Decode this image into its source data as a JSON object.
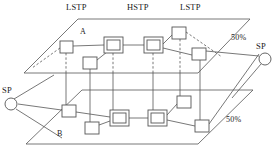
{
  "diagram": {
    "title_labels": {
      "lstp_left": "LSTP",
      "hstp_center": "HSTP",
      "lstp_right": "LSTP"
    },
    "plane_labels": {
      "top": "A",
      "bottom": "B"
    },
    "endpoint_labels": {
      "sp_left": "SP",
      "sp_right": "SP"
    },
    "percent_labels": {
      "top_right": "50%",
      "bottom_right": "50%"
    },
    "colors": {
      "line": "#555555",
      "node_fill": "#ffffff",
      "node_stroke": "#555555",
      "text": "#1a1a1a",
      "background": "#ffffff"
    },
    "planes": [
      {
        "name": "A",
        "corners": "78,19 250,19 198,73 24,73"
      },
      {
        "name": "B",
        "corners": "82,90 253,90 198,144 26,144"
      }
    ],
    "nodes": [
      {
        "id": "a-lstp-left",
        "type": "single",
        "plane": "A",
        "x": 60,
        "y": 41,
        "w": 13,
        "h": 12
      },
      {
        "id": "a-sub-left",
        "type": "single",
        "plane": "A",
        "x": 83,
        "y": 57,
        "w": 14,
        "h": 12
      },
      {
        "id": "a-hstp-1",
        "type": "double",
        "plane": "A",
        "x": 104,
        "y": 37,
        "w": 19,
        "h": 16
      },
      {
        "id": "a-hstp-2",
        "type": "double",
        "plane": "A",
        "x": 144,
        "y": 37,
        "w": 19,
        "h": 16
      },
      {
        "id": "a-lstp-top",
        "type": "single",
        "plane": "A",
        "x": 172,
        "y": 27,
        "w": 14,
        "h": 12
      },
      {
        "id": "a-lstp-right",
        "type": "single",
        "plane": "A",
        "x": 192,
        "y": 48,
        "w": 14,
        "h": 12
      },
      {
        "id": "b-lstp-left",
        "type": "single",
        "plane": "B",
        "x": 62,
        "y": 105,
        "w": 14,
        "h": 12
      },
      {
        "id": "b-sub-left",
        "type": "single",
        "plane": "B",
        "x": 85,
        "y": 122,
        "w": 14,
        "h": 12
      },
      {
        "id": "b-hstp-1",
        "type": "double",
        "plane": "B",
        "x": 110,
        "y": 110,
        "w": 19,
        "h": 16
      },
      {
        "id": "b-hstp-2",
        "type": "double",
        "plane": "B",
        "x": 148,
        "y": 110,
        "w": 19,
        "h": 16
      },
      {
        "id": "b-lstp-top",
        "type": "single",
        "plane": "B",
        "x": 177,
        "y": 96,
        "w": 14,
        "h": 12
      },
      {
        "id": "b-lstp-right",
        "type": "single",
        "plane": "B",
        "x": 195,
        "y": 120,
        "w": 14,
        "h": 12
      }
    ],
    "sp_nodes": [
      {
        "id": "sp-left",
        "cx": 11,
        "cy": 104,
        "r": 6
      },
      {
        "id": "sp-right",
        "cx": 265,
        "cy": 59,
        "r": 6
      }
    ],
    "label_positions": {
      "lstp_left": {
        "x": 66,
        "y": 3
      },
      "hstp_center": {
        "x": 127,
        "y": 3
      },
      "lstp_right": {
        "x": 180,
        "y": 3
      },
      "plane_a": {
        "x": 80,
        "y": 29
      },
      "plane_b": {
        "x": 57,
        "y": 131
      },
      "sp_left": {
        "x": 2,
        "y": 86
      },
      "sp_right": {
        "x": 256,
        "y": 43
      },
      "pct_top": {
        "x": 232,
        "y": 36
      },
      "pct_bottom": {
        "x": 227,
        "y": 117
      }
    }
  }
}
